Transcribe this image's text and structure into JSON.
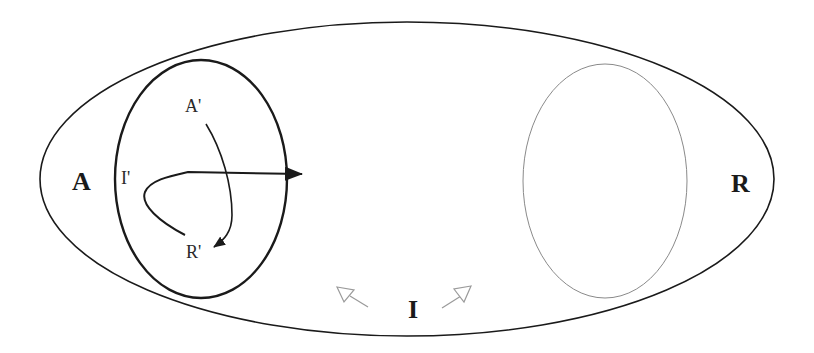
{
  "diagram": {
    "colors": {
      "background": "#ffffff",
      "stroke": "#1a1a1a",
      "gray_stroke": "#8a8a8a",
      "light_arrow": "#9a9a9a"
    },
    "outer_ellipse": {
      "cx": 407,
      "cy": 179,
      "rx": 367,
      "ry": 157
    },
    "left_ellipse": {
      "cx": 201,
      "cy": 179,
      "rx": 86,
      "ry": 119
    },
    "right_ellipse": {
      "cx": 605,
      "cy": 181,
      "rx": 82,
      "ry": 117
    },
    "labels": {
      "outer_left": "A",
      "outer_right": "R",
      "outer_bottom": "I",
      "inner_top": "A'",
      "inner_left": "I'",
      "inner_bottom": "R'"
    },
    "arrows": [
      {
        "name": "a-prime-to-r-prime",
        "type": "filled",
        "from": "A'",
        "to": "R'"
      },
      {
        "name": "i-prime-outward",
        "type": "filled",
        "from": "I'",
        "to": "outside left ellipse"
      },
      {
        "name": "i-left-hollow",
        "type": "hollow",
        "direction": "up-left"
      },
      {
        "name": "i-right-hollow",
        "type": "hollow",
        "direction": "up-right"
      }
    ]
  }
}
